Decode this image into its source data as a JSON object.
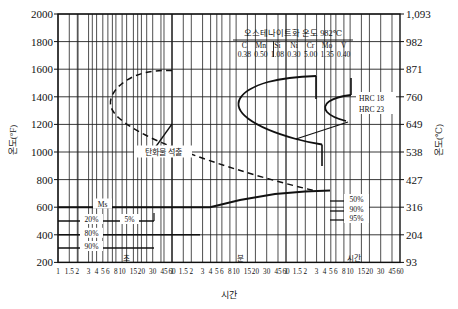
{
  "chart_data": {
    "type": "line",
    "title": "",
    "xlabel": "시간",
    "ylabel_left": "온도(°F)",
    "ylabel_right": "온도(℃)",
    "grid": true,
    "legend_position": "none",
    "x_axis": {
      "scale": "log-decades",
      "decade_labels": [
        "초",
        "분",
        "시간"
      ],
      "ticks": [
        "1",
        "1.5",
        "2",
        "3",
        "4",
        "5",
        "6",
        "8",
        "10",
        "15",
        "20",
        "30",
        "45",
        "60"
      ],
      "decade_count": 3
    },
    "y_axis_left": {
      "unit": "°F",
      "ticks": [
        2000,
        1800,
        1600,
        1400,
        1200,
        1000,
        800,
        600,
        400,
        200
      ],
      "ylim": [
        100,
        2000
      ]
    },
    "y_axis_right": {
      "unit": "℃",
      "ticks": [
        1093,
        982,
        871,
        760,
        649,
        538,
        427,
        316,
        204,
        93
      ]
    },
    "series": [
      {
        "name": "carbide-precipitation-curve",
        "style": "dashed",
        "label": "탄화물 석출"
      },
      {
        "name": "transformation-start-curve",
        "style": "solid",
        "label": "HRC 18"
      },
      {
        "name": "transformation-finish-curve",
        "style": "solid",
        "label": "HRC 23"
      },
      {
        "name": "ms-line",
        "style": "solid",
        "label": "Ms"
      }
    ],
    "annotations": [
      {
        "text": "오스테나이트화 온도 982℃",
        "name": "austenitizing-temperature"
      },
      {
        "text": "탄화물 석출",
        "name": "carbide-precipitation-label"
      },
      {
        "text": "Ms",
        "name": "ms-label"
      },
      {
        "text": "HRC 18",
        "name": "hrc-18-label"
      },
      {
        "text": "HRC 23",
        "name": "hrc-23-label"
      },
      {
        "text": "20%",
        "name": "pct-20-label"
      },
      {
        "text": "5%",
        "name": "pct-5-label"
      },
      {
        "text": "80%",
        "name": "pct-80-label"
      },
      {
        "text": "90%",
        "name": "pct-90-left-label"
      },
      {
        "text": "50%",
        "name": "pct-50-right-label"
      },
      {
        "text": "90%",
        "name": "pct-90-right-label"
      },
      {
        "text": "95%",
        "name": "pct-95-right-label"
      }
    ],
    "composition_table": {
      "headers": [
        "C",
        "Mn",
        "Si",
        "Ni",
        "Cr",
        "Mo",
        "V"
      ],
      "values": [
        "0.38",
        "0.50",
        "1.08",
        "0.30",
        "5.00",
        "1.35",
        "0.40"
      ]
    }
  },
  "axes": {
    "left_title": "온도(°F)",
    "right_title": "온도(℃)",
    "bottom_title": "시간",
    "left_ticks": [
      "2000",
      "1800",
      "1600",
      "1400",
      "1200",
      "1000",
      "800",
      "600",
      "400",
      "200"
    ],
    "right_ticks": [
      "1,093",
      "982",
      "871",
      "760",
      "649",
      "538",
      "427",
      "316",
      "204",
      "93"
    ],
    "decade_names": [
      "초",
      "분",
      "시간"
    ],
    "x_ticks": [
      "1",
      "1.5",
      "2",
      "3",
      "4",
      "5",
      "6",
      "8",
      "10",
      "15",
      "20",
      "30",
      "45",
      "60"
    ]
  },
  "header": {
    "austenitizing": "오스테나이트화 온도 982℃"
  },
  "composition": {
    "headers": [
      "C",
      "Mn",
      "Si",
      "Ni",
      "Cr",
      "Mo",
      "V"
    ],
    "values": [
      "0.38",
      "0.50",
      "1.08",
      "0.30",
      "5.00",
      "1.35",
      "0.40"
    ]
  },
  "labels": {
    "carbide": "탄화물 석출",
    "ms": "Ms",
    "hrc18": "HRC 18",
    "hrc23": "HRC 23",
    "pct20": "20%",
    "pct5": "5%",
    "pct80": "80%",
    "pct90_left": "90%",
    "pct50_right": "50%",
    "pct90_right": "90%",
    "pct95_right": "95%"
  },
  "colors": {
    "ink": "#111111",
    "grid": "#222222",
    "background": "#ffffff"
  }
}
